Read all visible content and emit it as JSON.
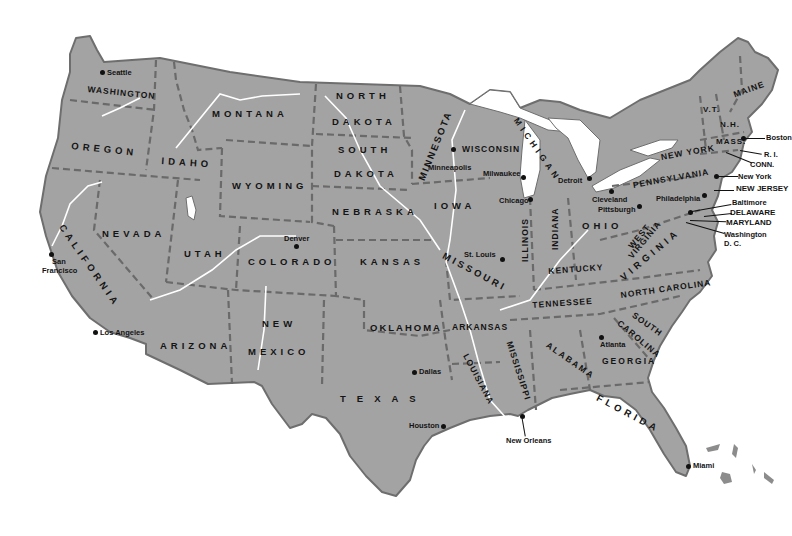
{
  "map": {
    "title": "United States",
    "land_color": "#a3a3a3",
    "border_color": "#6a6a6a",
    "water_color": "#ffffff",
    "states": [
      {
        "id": "washington",
        "label": "WASHINGTON"
      },
      {
        "id": "oregon",
        "label": "OREGON"
      },
      {
        "id": "california",
        "label": "CALIFORNIA"
      },
      {
        "id": "nevada",
        "label": "NEVADA"
      },
      {
        "id": "idaho",
        "label": "IDAHO"
      },
      {
        "id": "montana",
        "label": "MONTANA"
      },
      {
        "id": "wyoming",
        "label": "WYOMING"
      },
      {
        "id": "utah",
        "label": "UTAH"
      },
      {
        "id": "arizona",
        "label": "ARIZONA"
      },
      {
        "id": "colorado",
        "label": "COLORADO"
      },
      {
        "id": "new-mexico-1",
        "label": "NEW"
      },
      {
        "id": "new-mexico-2",
        "label": "MEXICO"
      },
      {
        "id": "north-dakota-1",
        "label": "NORTH"
      },
      {
        "id": "north-dakota-2",
        "label": "DAKOTA"
      },
      {
        "id": "south-dakota-1",
        "label": "SOUTH"
      },
      {
        "id": "south-dakota-2",
        "label": "DAKOTA"
      },
      {
        "id": "nebraska",
        "label": "NEBRASKA"
      },
      {
        "id": "kansas",
        "label": "KANSAS"
      },
      {
        "id": "oklahoma",
        "label": "OKLAHOMA"
      },
      {
        "id": "texas",
        "label": "TEXAS"
      },
      {
        "id": "minnesota",
        "label": "MINNESOTA"
      },
      {
        "id": "iowa",
        "label": "IOWA"
      },
      {
        "id": "missouri",
        "label": "MISSOURI"
      },
      {
        "id": "arkansas",
        "label": "ARKANSAS"
      },
      {
        "id": "louisiana",
        "label": "LOUISIANA"
      },
      {
        "id": "wisconsin",
        "label": "WISCONSIN"
      },
      {
        "id": "illinois",
        "label": "ILLINOIS"
      },
      {
        "id": "michigan",
        "label": "MICHIGAN"
      },
      {
        "id": "indiana",
        "label": "INDIANA"
      },
      {
        "id": "ohio",
        "label": "OHIO"
      },
      {
        "id": "kentucky",
        "label": "KENTUCKY"
      },
      {
        "id": "tennessee",
        "label": "TENNESSEE"
      },
      {
        "id": "mississippi",
        "label": "MISSISSIPPI"
      },
      {
        "id": "alabama",
        "label": "ALABAMA"
      },
      {
        "id": "georgia",
        "label": "GEORGIA"
      },
      {
        "id": "florida",
        "label": "FLORIDA"
      },
      {
        "id": "south-carolina-1",
        "label": "SOUTH"
      },
      {
        "id": "south-carolina-2",
        "label": "CAROLINA"
      },
      {
        "id": "north-carolina",
        "label": "NORTH CAROLINA"
      },
      {
        "id": "virginia",
        "label": "VIRGINIA"
      },
      {
        "id": "west-virginia-1",
        "label": "WEST"
      },
      {
        "id": "west-virginia-2",
        "label": "VIRGINIA"
      },
      {
        "id": "pennsylvania",
        "label": "PENNSYLVANIA"
      },
      {
        "id": "new-york",
        "label": "NEW YORK"
      },
      {
        "id": "vermont",
        "label": "V.T."
      },
      {
        "id": "new-hampshire",
        "label": "N.H."
      },
      {
        "id": "maine",
        "label": "MAINE"
      },
      {
        "id": "massachusetts",
        "label": "MASS."
      }
    ],
    "callouts": [
      {
        "id": "boston",
        "label": "Boston"
      },
      {
        "id": "rhode-island",
        "label": "R. I."
      },
      {
        "id": "connecticut",
        "label": "CONN."
      },
      {
        "id": "new-york-city",
        "label": "New York"
      },
      {
        "id": "new-jersey",
        "label": "NEW JERSEY"
      },
      {
        "id": "baltimore",
        "label": "Baltimore"
      },
      {
        "id": "delaware",
        "label": "DELAWARE"
      },
      {
        "id": "maryland",
        "label": "MARYLAND"
      },
      {
        "id": "washington-dc-1",
        "label": "Washington"
      },
      {
        "id": "washington-dc-2",
        "label": "D. C."
      }
    ],
    "cities": [
      {
        "id": "seattle",
        "label": "Seattle"
      },
      {
        "id": "san-francisco-1",
        "label": "San"
      },
      {
        "id": "san-francisco-2",
        "label": "Francisco"
      },
      {
        "id": "los-angeles",
        "label": "Los Angeles"
      },
      {
        "id": "denver",
        "label": "Denver"
      },
      {
        "id": "dallas",
        "label": "Dallas"
      },
      {
        "id": "houston",
        "label": "Houston"
      },
      {
        "id": "new-orleans",
        "label": "New Orleans"
      },
      {
        "id": "minneapolis",
        "label": "Minneapolis"
      },
      {
        "id": "milwaukee",
        "label": "Milwaukee"
      },
      {
        "id": "chicago",
        "label": "Chicago"
      },
      {
        "id": "st-louis",
        "label": "St. Louis"
      },
      {
        "id": "detroit",
        "label": "Detroit"
      },
      {
        "id": "cleveland",
        "label": "Cleveland"
      },
      {
        "id": "pittsburgh",
        "label": "Pittsburgh"
      },
      {
        "id": "philadelphia",
        "label": "Philadelphia"
      },
      {
        "id": "atlanta",
        "label": "Atlanta"
      },
      {
        "id": "miami",
        "label": "Miami"
      }
    ]
  }
}
